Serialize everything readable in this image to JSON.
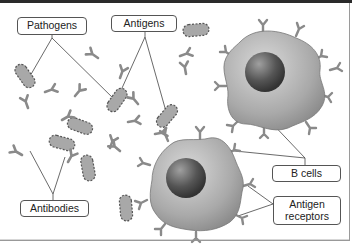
{
  "diagram": {
    "type": "biology-illustration",
    "labels": {
      "pathogens": "Pathogens",
      "antigens": "Antigens",
      "b_cells": "B cells",
      "antigen_receptors_line1": "Antigen",
      "antigen_receptors_line2": "receptors",
      "antibodies": "Antibodies"
    },
    "colors": {
      "pathogen_fill": "#a8a8a8",
      "pathogen_stroke": "#555555",
      "antibody": "#8a8a8a",
      "cell_fill": "#b5b5b5",
      "nucleus": "#555555",
      "leader_line": "#444444",
      "label_border": "#555555"
    }
  }
}
